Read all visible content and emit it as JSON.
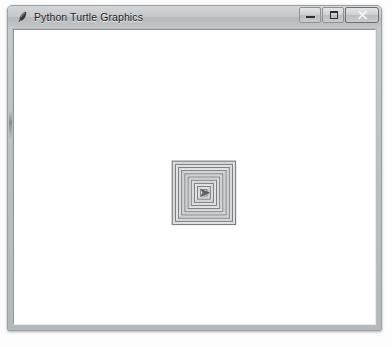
{
  "window": {
    "title": "Python Turtle Graphics",
    "app_icon": "turtle-feather-icon",
    "frame_color": "#bdc1c4",
    "titlebar_text_color": "#1b1b1e",
    "controls": [
      {
        "name": "minimize",
        "label": "Minimize",
        "glyph": "minimize-icon"
      },
      {
        "name": "maximize",
        "label": "Maximize",
        "glyph": "maximize-icon"
      },
      {
        "name": "close",
        "label": "Close",
        "glyph": "close-icon"
      }
    ]
  },
  "canvas": {
    "background_color": "#ffffff",
    "drawing_name": "nested-squares-spiral",
    "pen_color": "#7d8184",
    "turtle_color": "#5f6366",
    "drawing": {
      "type": "concentric-squares",
      "center_x": 203,
      "center_y": 196,
      "square_count": 10,
      "outer_half_size": 32,
      "step": 3.2,
      "rotation_deg": 0
    },
    "turtle": {
      "visible": true,
      "x": 203,
      "y": 196,
      "heading_deg": 0,
      "size": 7
    }
  }
}
